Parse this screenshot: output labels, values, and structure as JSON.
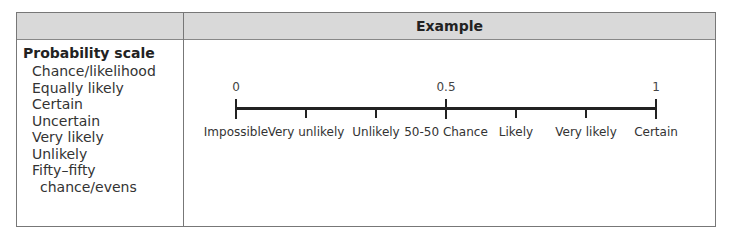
{
  "table": {
    "header": {
      "left": "",
      "right": "Example"
    },
    "left_column": {
      "heading": "Probability scale",
      "items": [
        "Chance/likelihood",
        "Equally likely",
        "Certain",
        "Uncertain",
        "Very likely",
        "Unlikely",
        "Fifty–fifty",
        "chance/evens"
      ]
    },
    "scale": {
      "numbers": [
        {
          "value": "0",
          "pos": 0
        },
        {
          "value": "0.5",
          "pos": 0.5
        },
        {
          "value": "1",
          "pos": 1
        }
      ],
      "labels": [
        {
          "text": "Impossible",
          "pos": 0
        },
        {
          "text": "Very unlikely",
          "pos": 0.1667
        },
        {
          "text": "Unlikely",
          "pos": 0.3333
        },
        {
          "text": "50-50 Chance",
          "pos": 0.5
        },
        {
          "text": "Likely",
          "pos": 0.6667
        },
        {
          "text": "Very likely",
          "pos": 0.8333
        },
        {
          "text": "Certain",
          "pos": 1
        }
      ]
    }
  }
}
